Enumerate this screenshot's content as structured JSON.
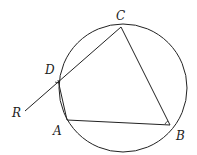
{
  "diagram": {
    "type": "cyclic quadrilateral with extended chord",
    "circle": {
      "cx": 123,
      "cy": 88,
      "r": 64
    },
    "points": {
      "A": {
        "label": "A",
        "x": 67,
        "y": 120
      },
      "B": {
        "label": "B",
        "x": 170,
        "y": 125
      },
      "C": {
        "label": "C",
        "x": 121,
        "y": 27
      },
      "D": {
        "label": "D",
        "x": 58,
        "y": 78
      },
      "R": {
        "label": "R",
        "x": 25,
        "y": 111
      }
    },
    "segments": [
      "CR (through D)",
      "DA",
      "AB",
      "BC"
    ],
    "angle_marks": [
      "D",
      "B"
    ],
    "colors": {
      "stroke": "#222222",
      "background": "#ffffff"
    }
  }
}
